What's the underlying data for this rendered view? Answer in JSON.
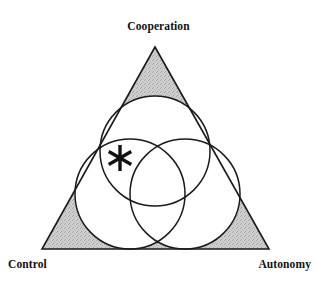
{
  "figure": {
    "name": "cooperation-control-autonomy-triangle",
    "background_color": "#ffffff",
    "stroke_color": "#1a1a1a",
    "shade_color": "#c9c9c9",
    "marker_glyph": "✱"
  },
  "labels": {
    "top": "Cooperation",
    "bottom_left": "Control",
    "bottom_right": "Autonomy"
  },
  "chart_data": {
    "type": "diagram",
    "subtype": "venn-in-triangle",
    "title": "",
    "triangle": {
      "vertices": [
        {
          "label": "Cooperation",
          "x": 155,
          "y": 47
        },
        {
          "label": "Control",
          "x": 42,
          "y": 249
        },
        {
          "label": "Autonomy",
          "x": 269,
          "y": 249
        }
      ],
      "fill": "#c9c9c9",
      "stroke": "#1a1a1a",
      "stroke_width": 1.6
    },
    "circles": [
      {
        "name": "cooperation-circle",
        "cx": 155,
        "cy": 151,
        "r": 55,
        "fill": "#ffffff",
        "stroke": "#1a1a1a"
      },
      {
        "name": "control-circle",
        "cx": 130,
        "cy": 194,
        "r": 55,
        "fill": "#ffffff",
        "stroke": "#1a1a1a"
      },
      {
        "name": "autonomy-circle",
        "cx": 185,
        "cy": 194,
        "r": 55,
        "fill": "#ffffff",
        "stroke": "#1a1a1a"
      }
    ],
    "markers": [
      {
        "name": "asterisk-marker",
        "symbol": "*",
        "x": 120,
        "y": 158,
        "size": 26
      }
    ],
    "shaded_regions": [
      "top-corner",
      "bottom-left-corner",
      "bottom-right-corner"
    ],
    "legend": null,
    "xlabel": "",
    "ylabel": ""
  }
}
